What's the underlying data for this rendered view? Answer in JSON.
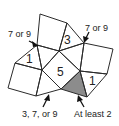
{
  "diagram": {
    "type": "tiling-puzzle",
    "shaded_color": "#8c8c8c",
    "line_color": "#2b2b2b",
    "regions": [
      {
        "id": "triangle-top",
        "label": "3"
      },
      {
        "id": "triangle-left",
        "label": "1"
      },
      {
        "id": "square-center",
        "label": "5"
      },
      {
        "id": "triangle-right",
        "label": "1"
      },
      {
        "id": "triangle-shaded",
        "label": ""
      }
    ],
    "annotations": [
      {
        "id": "top-left-vertex",
        "text": "7 or 9"
      },
      {
        "id": "top-right-vertex",
        "text": "7 or 9"
      },
      {
        "id": "bottom-left-vertex",
        "text": "3, 7, or 9"
      },
      {
        "id": "bottom-right-vertex",
        "text": "At least 2"
      }
    ]
  }
}
